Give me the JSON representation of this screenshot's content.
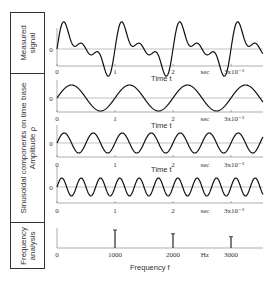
{
  "row_labels": {
    "measured": [
      "Measured",
      "signal"
    ],
    "components": [
      "Sinusoidal components on time base",
      "Amplitude ρ"
    ],
    "frequency": [
      "Frequency",
      "analysis"
    ]
  },
  "time_axis": {
    "ticks": [
      "0",
      "1",
      "2",
      "sec",
      "3x10⁻³"
    ],
    "label": "Time t",
    "zero_label": "0"
  },
  "frequency_axis": {
    "ticks": [
      "0",
      "1000",
      "2000",
      "Hz",
      "3000"
    ],
    "label": "Frequency f"
  },
  "chart_data": [
    {
      "type": "line",
      "title": "Measured signal",
      "xlabel": "Time t (sec ×10⁻³)",
      "x_range": [
        0,
        3.55
      ],
      "description": "Sum of 1000 Hz, 2000 Hz and 3000 Hz sinusoids",
      "components_hz": [
        1000,
        2000,
        3000
      ],
      "amplitudes": [
        1.0,
        0.75,
        0.55
      ]
    },
    {
      "type": "line",
      "title": "Component 1",
      "frequency_hz": 1000,
      "amplitude": 1.0,
      "xlabel": "Time t",
      "x_range": [
        0,
        3.55
      ]
    },
    {
      "type": "line",
      "title": "Component 2",
      "frequency_hz": 2000,
      "amplitude": 0.75,
      "xlabel": "Time t",
      "x_range": [
        0,
        3.55
      ]
    },
    {
      "type": "line",
      "title": "Component 3",
      "frequency_hz": 3000,
      "amplitude": 0.55,
      "xlabel": "Time t",
      "x_range": [
        0,
        3.55
      ]
    },
    {
      "type": "bar",
      "title": "Frequency analysis",
      "xlabel": "Frequency f (Hz)",
      "categories": [
        "1000",
        "2000",
        "3000"
      ],
      "values": [
        1.0,
        0.75,
        0.55
      ]
    }
  ]
}
